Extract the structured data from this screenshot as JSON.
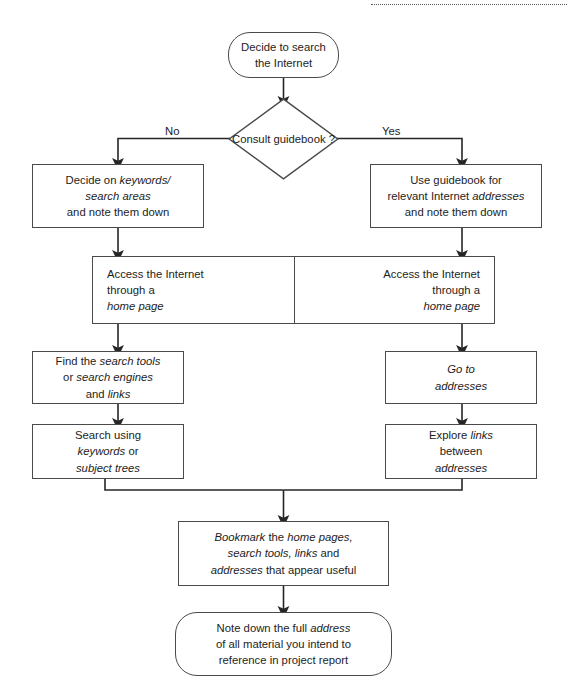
{
  "diagram": {
    "colors": {
      "stroke": "#4a4a4a",
      "text": "#1d1d1d",
      "background": "#ffffff",
      "connector": "#262626"
    },
    "top_rule": "dotted-rule"
  },
  "nodes": {
    "start": {
      "name": "decide-to-search",
      "shape": "terminator",
      "lines": [
        {
          "text": "Decide to search",
          "italic": false
        },
        {
          "text": "the Internet",
          "italic": false
        }
      ]
    },
    "decision": {
      "name": "consult-guidebook-decision",
      "shape": "diamond",
      "lines": [
        {
          "text": "Consult",
          "italic": false
        },
        {
          "text": "guidebook",
          "italic": false
        },
        {
          "text": "?",
          "italic": false
        }
      ],
      "branch_no": "No",
      "branch_yes": "Yes"
    },
    "left_keywords": {
      "name": "decide-on-keywords",
      "shape": "process",
      "lines": [
        {
          "parts": [
            {
              "t": "Decide on ",
              "i": false
            },
            {
              "t": "keywords/",
              "i": true
            }
          ]
        },
        {
          "parts": [
            {
              "t": "search areas",
              "i": true
            }
          ]
        },
        {
          "parts": [
            {
              "t": "and note them down",
              "i": false
            }
          ]
        }
      ]
    },
    "right_guidebook": {
      "name": "use-guidebook-for-addresses",
      "shape": "process",
      "lines": [
        {
          "parts": [
            {
              "t": "Use guidebook for",
              "i": false
            }
          ]
        },
        {
          "parts": [
            {
              "t": "relevant Internet ",
              "i": false
            },
            {
              "t": "addresses",
              "i": true
            }
          ]
        },
        {
          "parts": [
            {
              "t": "and note them down",
              "i": false
            }
          ]
        }
      ]
    },
    "band_left": {
      "name": "access-internet-left",
      "shape": "process-half",
      "lines": [
        {
          "parts": [
            {
              "t": "Access the Internet",
              "i": false
            }
          ]
        },
        {
          "parts": [
            {
              "t": "through a",
              "i": false
            }
          ]
        },
        {
          "parts": [
            {
              "t": "home page",
              "i": true
            }
          ]
        }
      ]
    },
    "band_right": {
      "name": "access-internet-right",
      "shape": "process-half",
      "lines": [
        {
          "parts": [
            {
              "t": "Access the Internet",
              "i": false
            }
          ]
        },
        {
          "parts": [
            {
              "t": "through a",
              "i": false
            }
          ]
        },
        {
          "parts": [
            {
              "t": "home page",
              "i": true
            }
          ]
        }
      ]
    },
    "left_find_tools": {
      "name": "find-search-tools",
      "shape": "process",
      "lines": [
        {
          "parts": [
            {
              "t": "Find the ",
              "i": false
            },
            {
              "t": "search tools",
              "i": true
            }
          ]
        },
        {
          "parts": [
            {
              "t": "or ",
              "i": false
            },
            {
              "t": "search engines",
              "i": true
            }
          ]
        },
        {
          "parts": [
            {
              "t": "and ",
              "i": false
            },
            {
              "t": "links",
              "i": true
            }
          ]
        }
      ]
    },
    "right_go_to": {
      "name": "go-to-addresses",
      "shape": "process",
      "lines": [
        {
          "parts": [
            {
              "t": "Go to",
              "i": true
            }
          ]
        },
        {
          "parts": [
            {
              "t": "addresses",
              "i": true
            }
          ]
        }
      ]
    },
    "left_search_using": {
      "name": "search-using-keywords",
      "shape": "process",
      "lines": [
        {
          "parts": [
            {
              "t": "Search using",
              "i": false
            }
          ]
        },
        {
          "parts": [
            {
              "t": "keywords",
              "i": true
            },
            {
              "t": " or",
              "i": false
            }
          ]
        },
        {
          "parts": [
            {
              "t": "subject trees",
              "i": true
            }
          ]
        }
      ]
    },
    "right_explore_links": {
      "name": "explore-links-between-addresses",
      "shape": "process",
      "lines": [
        {
          "parts": [
            {
              "t": "Explore ",
              "i": false
            },
            {
              "t": "links",
              "i": true
            }
          ]
        },
        {
          "parts": [
            {
              "t": "between",
              "i": false
            }
          ]
        },
        {
          "parts": [
            {
              "t": "addresses",
              "i": true
            }
          ]
        }
      ]
    },
    "bookmark": {
      "name": "bookmark-useful-pages",
      "shape": "process",
      "lines": [
        {
          "parts": [
            {
              "t": "Bookmark",
              "i": true
            },
            {
              "t": " the ",
              "i": false
            },
            {
              "t": "home pages,",
              "i": true
            }
          ]
        },
        {
          "parts": [
            {
              "t": "search tools, links",
              "i": true
            },
            {
              "t": " and",
              "i": false
            }
          ]
        },
        {
          "parts": [
            {
              "t": "addresses",
              "i": true
            },
            {
              "t": " that appear useful",
              "i": false
            }
          ]
        }
      ]
    },
    "end": {
      "name": "note-down-full-address",
      "shape": "terminator",
      "lines": [
        {
          "parts": [
            {
              "t": "Note down the full ",
              "i": false
            },
            {
              "t": "address",
              "i": true
            }
          ]
        },
        {
          "parts": [
            {
              "t": "of all material you intend to",
              "i": false
            }
          ]
        },
        {
          "parts": [
            {
              "t": "reference in project report",
              "i": false
            }
          ]
        }
      ]
    }
  }
}
